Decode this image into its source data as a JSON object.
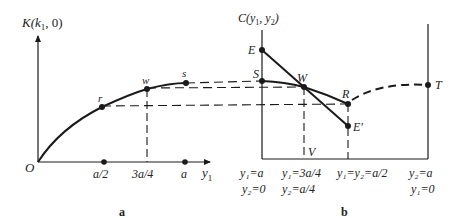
{
  "panel_a": {
    "caption": "a",
    "y_axis_label": "K(k",
    "y_axis_label_sub": "1",
    "y_axis_label_tail": ", 0)",
    "x_axis_label": "y",
    "x_axis_label_sub": "1",
    "origin_label": "O",
    "points": [
      {
        "name": "r",
        "label": "r"
      },
      {
        "name": "w",
        "label": "w"
      },
      {
        "name": "s",
        "label": "s"
      }
    ],
    "ticks": [
      {
        "label": "a/2"
      },
      {
        "label": "3a/4"
      },
      {
        "label": "a"
      }
    ]
  },
  "panel_b": {
    "caption": "b",
    "y_axis_label": "C(y",
    "y_axis_label_sub1": "1",
    "y_axis_label_mid": ", y",
    "y_axis_label_sub2": "2",
    "y_axis_label_tail": ")",
    "points": [
      {
        "name": "E",
        "label": "E"
      },
      {
        "name": "S",
        "label": "S"
      },
      {
        "name": "W",
        "label": "W"
      },
      {
        "name": "R",
        "label": "R"
      },
      {
        "name": "E-prime",
        "label": "E′"
      },
      {
        "name": "T",
        "label": "T"
      },
      {
        "name": "V",
        "label": "V"
      }
    ],
    "x_labels": [
      {
        "line1": "y₁=a",
        "line2": "y₂=0"
      },
      {
        "line1": "y₁=3a/4",
        "line2": "y₂=a/4"
      },
      {
        "line1": "y₁=y₂=a/2",
        "line2": ""
      },
      {
        "line1": "y₂=a",
        "line2": "y₁=0"
      }
    ]
  },
  "colors": {
    "ink": "#1a1a1a",
    "text": "#222222",
    "background": "#ffffff"
  }
}
